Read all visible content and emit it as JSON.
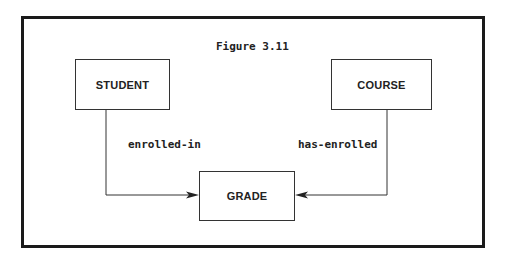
{
  "figure": {
    "title": "Figure 3.11",
    "entities": [
      {
        "id": "student",
        "label": "STUDENT"
      },
      {
        "id": "course",
        "label": "COURSE"
      },
      {
        "id": "grade",
        "label": "GRADE"
      }
    ],
    "relationships": [
      {
        "from": "student",
        "to": "grade",
        "label": "enrolled-in"
      },
      {
        "from": "course",
        "to": "grade",
        "label": "has-enrolled"
      }
    ]
  }
}
